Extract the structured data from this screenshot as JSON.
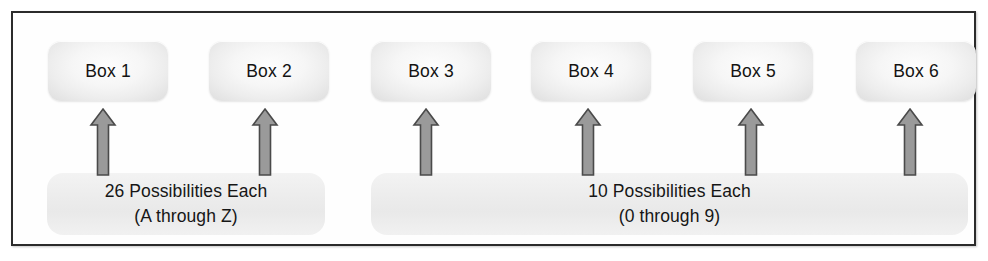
{
  "diagram": {
    "frame": {
      "border_color": "#2b2b2b",
      "background": "#fefefe"
    },
    "boxes": [
      {
        "label": "Box 1",
        "x": 35,
        "group": "letters"
      },
      {
        "label": "Box 2",
        "x": 196,
        "group": "letters"
      },
      {
        "label": "Box 3",
        "x": 358,
        "group": "digits"
      },
      {
        "label": "Box 4",
        "x": 518,
        "group": "digits"
      },
      {
        "label": "Box 5",
        "x": 680,
        "group": "digits"
      },
      {
        "label": "Box 6",
        "x": 843,
        "group": "digits"
      }
    ],
    "arrows": [
      {
        "name": "arrow-to-box-1",
        "x": 76
      },
      {
        "name": "arrow-to-box-2",
        "x": 238
      },
      {
        "name": "arrow-to-box-3",
        "x": 399
      },
      {
        "name": "arrow-to-box-4",
        "x": 561
      },
      {
        "name": "arrow-to-box-5",
        "x": 724
      },
      {
        "name": "arrow-to-box-6",
        "x": 883
      }
    ],
    "bands": [
      {
        "name": "letters-band",
        "line1": "26 Possibilities Each",
        "line2": "(A through Z)",
        "count": 26,
        "range": "A through Z",
        "applies_to": [
          "Box 1",
          "Box 2"
        ],
        "fill": "#ececec"
      },
      {
        "name": "digits-band",
        "line1": "10 Possibilities Each",
        "line2": "(0 through 9)",
        "count": 10,
        "range": "0 through 9",
        "applies_to": [
          "Box 3",
          "Box 4",
          "Box 5",
          "Box 6"
        ],
        "fill": "#ececec"
      }
    ],
    "colors": {
      "arrow_fill": "#9a9a9a",
      "arrow_stroke": "#4a4a4a",
      "box_text": "#131313",
      "band_text": "#161616"
    }
  }
}
